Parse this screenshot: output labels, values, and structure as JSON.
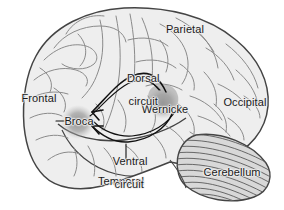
{
  "figure": {
    "background_color": "#ffffff",
    "outline_color": "#444444",
    "cortex_fill": "#eeeeee",
    "sulci_color": "#8a8a8a",
    "cerebellum_fill": "#d8d8d8",
    "cerebellum_stripe_color": "#5a5a5a",
    "region_blob_color": "#9b9b9b",
    "arrow_color": "#111111",
    "label_color": "#1a1a1a"
  },
  "labels": {
    "lobes": [
      {
        "id": "frontal",
        "text": "Frontal",
        "x": 18,
        "y": 93,
        "width": 42
      },
      {
        "id": "parietal",
        "text": "Parietal",
        "x": 162,
        "y": 24,
        "width": 46
      },
      {
        "id": "occipital",
        "text": "Occipital",
        "x": 220,
        "y": 97,
        "width": 50
      },
      {
        "id": "temporal",
        "text": "Temporal",
        "x": 96,
        "y": 176,
        "width": 50
      },
      {
        "id": "cerebellum",
        "text": "Cerebellum",
        "x": 202,
        "y": 167,
        "width": 60
      }
    ],
    "areas": [
      {
        "id": "broca",
        "text": "Broca",
        "x": 59,
        "y": 116,
        "width": 40
      },
      {
        "id": "wernicke",
        "text": "Wernicke",
        "x": 139,
        "y": 104,
        "width": 52
      }
    ],
    "circuits": [
      {
        "id": "dorsal-circuit",
        "line1": "Dorsal",
        "line2": "circuit",
        "x": 114,
        "y": 61,
        "width": 46
      },
      {
        "id": "ventral-circuit",
        "line1": "Ventral",
        "line2": "circuit",
        "x": 100,
        "y": 144,
        "width": 46
      }
    ]
  },
  "regions": {
    "broca": {
      "cx": 78,
      "cy": 122,
      "r": 17
    },
    "wernicke": {
      "cx": 163,
      "cy": 103,
      "r": 16
    }
  },
  "arrows": {
    "dorsal": {
      "from": "Wernicke",
      "to": "Broca",
      "path": "arcuate-superior"
    },
    "ventral": {
      "from": "Wernicke",
      "to": "Broca",
      "path": "ventral-inferior"
    }
  }
}
